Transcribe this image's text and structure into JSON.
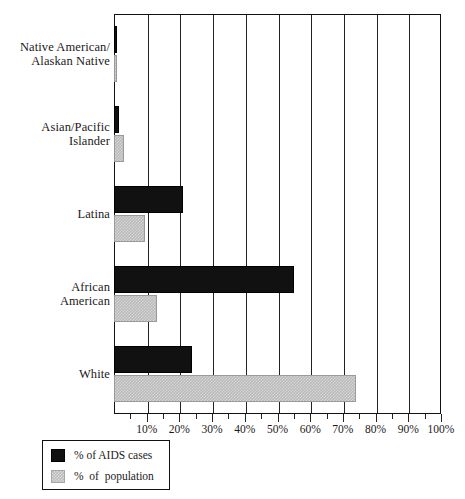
{
  "chart_data": {
    "type": "bar",
    "orientation": "horizontal",
    "title": "",
    "xlabel": "",
    "ylabel": "",
    "xlim": [
      0,
      100
    ],
    "xtick_labels": [
      "10%",
      "20%",
      "30%",
      "40%",
      "50%",
      "60%",
      "70%",
      "80%",
      "90%",
      "100%"
    ],
    "xtick_values": [
      10,
      20,
      30,
      40,
      50,
      60,
      70,
      80,
      90,
      100
    ],
    "minor_tick_step": 5,
    "grid": true,
    "grid_axis": "x",
    "legend_position": "below-left",
    "categories": [
      "Native American/\nAlaskan Native",
      "Asian/Pacific\nIslander",
      "Latina",
      "African\nAmerican",
      "White"
    ],
    "series": [
      {
        "name": "% of AIDS cases",
        "color": "#111111",
        "values": [
          1.0,
          1.5,
          21.0,
          55.0,
          24.0
        ]
      },
      {
        "name": "% of population",
        "color": "#b9b9b9",
        "values": [
          1.0,
          3.0,
          9.5,
          13.0,
          74.0
        ]
      }
    ]
  },
  "categories": [
    {
      "line1": "Native American/",
      "line2": "Alaskan Native"
    },
    {
      "line1": "Asian/Pacific",
      "line2": "Islander"
    },
    {
      "line1": "Latina",
      "line2": ""
    },
    {
      "line1": "African",
      "line2": "American"
    },
    {
      "line1": "White",
      "line2": ""
    }
  ],
  "legend": {
    "items": [
      {
        "label": "% of AIDS cases"
      },
      {
        "label": "%  of  population"
      }
    ]
  },
  "axis": {
    "ticks": [
      {
        "label": "10%"
      },
      {
        "label": "20%"
      },
      {
        "label": "30%"
      },
      {
        "label": "40%"
      },
      {
        "label": "50%"
      },
      {
        "label": "60%"
      },
      {
        "label": "70%"
      },
      {
        "label": "80%"
      },
      {
        "label": "90%"
      },
      {
        "label": "100%"
      }
    ]
  }
}
